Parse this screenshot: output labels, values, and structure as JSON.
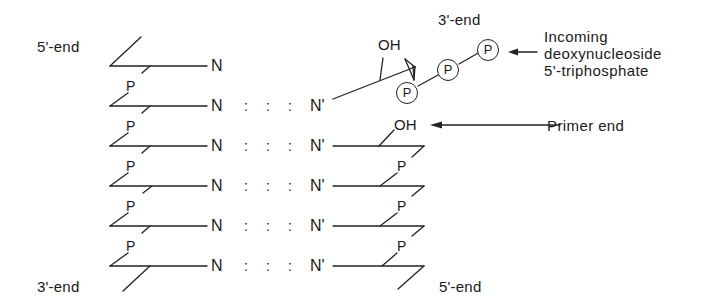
{
  "figure": {
    "template_strand": {
      "top_label": "5'-end",
      "bottom_label": "3'-end",
      "base_label": "N",
      "phosphate_label": "P",
      "rows": 6
    },
    "primer_strand": {
      "top_label": "3'-end",
      "bottom_label": "5'-end",
      "base_label": "N'",
      "phosphate_label": "P",
      "hydroxyl_label": "OH",
      "rows": 5
    },
    "pairing_symbol": ":",
    "incoming": {
      "phosphates": [
        "P",
        "P",
        "P"
      ],
      "hydroxyl_label": "OH"
    },
    "annotations": {
      "incoming_line1": "Incoming",
      "incoming_line2": "deoxynucleoside",
      "incoming_line3": "5'-triphosphate",
      "primer_end": "Primer end"
    },
    "colors": {
      "ink": "#1a1a1a",
      "background": "#ffffff"
    }
  }
}
